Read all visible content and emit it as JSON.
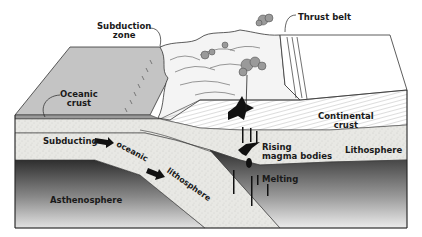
{
  "labels": {
    "subduction_zone": [
      "Subduction",
      "zone"
    ],
    "thrust_belt": "Thrust belt",
    "oceanic_crust": [
      "Oceanic",
      "crust"
    ],
    "continental_crust": [
      "Continental",
      "crust"
    ],
    "subducting": "Subducting",
    "oceanic": "oceanic",
    "lithosphere_slab": "lithosphere",
    "rising_magma": [
      "Rising",
      "magma bodies"
    ],
    "lithosphere": "Lithosphere",
    "melting": "Melting",
    "asthenosphere": "Asthenosphere"
  },
  "colors": {
    "ocean_surface": "#c8c8c8",
    "continent_surface": "#ffffff",
    "lithosphere": "#e6e6e2",
    "asthenosphere_dark": "#3a3a3a",
    "asthenosphere_light": "#d8d8d8",
    "magma": "#111111",
    "outline": "#333333"
  }
}
